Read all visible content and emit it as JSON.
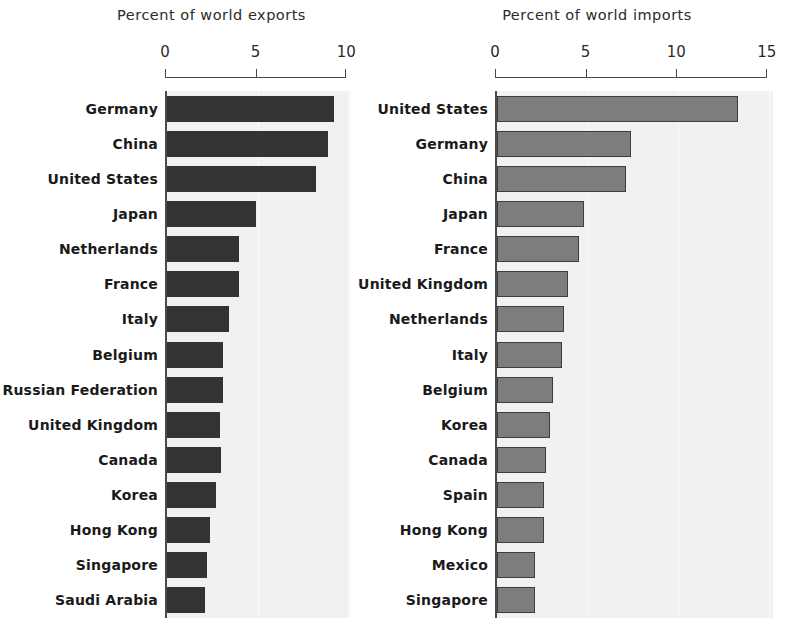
{
  "chart_data": [
    {
      "type": "bar",
      "orientation": "horizontal",
      "title": "Percent of world exports",
      "xlabel": "",
      "ylabel": "",
      "xlim": [
        0,
        10
      ],
      "xticks": [
        0,
        5,
        10
      ],
      "xticklabels": [
        "0",
        "5",
        "10"
      ],
      "grid": true,
      "legend": "none",
      "bar_color": "#333333",
      "plot_background": "#f1f1f1",
      "categories": [
        "Germany",
        "China",
        "United States",
        "Japan",
        "Netherlands",
        "France",
        "Italy",
        "Belgium",
        "Russian Federation",
        "United Kingdom",
        "Canada",
        "Korea",
        "Hong Kong",
        "Singapore",
        "Saudi Arabia"
      ],
      "values": [
        9.2,
        8.9,
        8.2,
        4.9,
        4.0,
        4.0,
        3.4,
        3.1,
        3.1,
        2.9,
        3.0,
        2.7,
        2.4,
        2.2,
        2.1
      ]
    },
    {
      "type": "bar",
      "orientation": "horizontal",
      "title": "Percent of world imports",
      "xlabel": "",
      "ylabel": "",
      "xlim": [
        0,
        15
      ],
      "xticks": [
        0,
        5,
        10,
        15
      ],
      "xticklabels": [
        "0",
        "5",
        "10",
        "15"
      ],
      "grid": true,
      "legend": "none",
      "bar_color": "#7d7d7d",
      "plot_background": "#f1f1f1",
      "categories": [
        "United States",
        "Germany",
        "China",
        "Japan",
        "France",
        "United Kingdom",
        "Netherlands",
        "Italy",
        "Belgium",
        "Korea",
        "Canada",
        "Spain",
        "Hong Kong",
        "Mexico",
        "Singapore"
      ],
      "values": [
        13.3,
        7.4,
        7.1,
        4.8,
        4.5,
        3.9,
        3.7,
        3.6,
        3.1,
        2.9,
        2.7,
        2.6,
        2.6,
        2.1,
        2.1
      ]
    }
  ],
  "panels": {
    "exports": {
      "title": "Percent of world exports",
      "ticks": [
        "0",
        "5",
        "10"
      ],
      "rows": [
        {
          "label": "Germany",
          "value": 9.2
        },
        {
          "label": "China",
          "value": 8.9
        },
        {
          "label": "United States",
          "value": 8.2
        },
        {
          "label": "Japan",
          "value": 4.9
        },
        {
          "label": "Netherlands",
          "value": 4.0
        },
        {
          "label": "France",
          "value": 4.0
        },
        {
          "label": "Italy",
          "value": 3.4
        },
        {
          "label": "Belgium",
          "value": 3.1
        },
        {
          "label": "Russian Federation",
          "value": 3.1
        },
        {
          "label": "United Kingdom",
          "value": 2.9
        },
        {
          "label": "Canada",
          "value": 3.0
        },
        {
          "label": "Korea",
          "value": 2.7
        },
        {
          "label": "Hong Kong",
          "value": 2.4
        },
        {
          "label": "Singapore",
          "value": 2.2
        },
        {
          "label": "Saudi Arabia",
          "value": 2.1
        }
      ]
    },
    "imports": {
      "title": "Percent of world imports",
      "ticks": [
        "0",
        "5",
        "10",
        "15"
      ],
      "rows": [
        {
          "label": "United States",
          "value": 13.3
        },
        {
          "label": "Germany",
          "value": 7.4
        },
        {
          "label": "China",
          "value": 7.1
        },
        {
          "label": "Japan",
          "value": 4.8
        },
        {
          "label": "France",
          "value": 4.5
        },
        {
          "label": "United Kingdom",
          "value": 3.9
        },
        {
          "label": "Netherlands",
          "value": 3.7
        },
        {
          "label": "Italy",
          "value": 3.6
        },
        {
          "label": "Belgium",
          "value": 3.1
        },
        {
          "label": "Korea",
          "value": 2.9
        },
        {
          "label": "Canada",
          "value": 2.7
        },
        {
          "label": "Spain",
          "value": 2.6
        },
        {
          "label": "Hong Kong",
          "value": 2.6
        },
        {
          "label": "Mexico",
          "value": 2.1
        },
        {
          "label": "Singapore",
          "value": 2.1
        }
      ]
    }
  }
}
